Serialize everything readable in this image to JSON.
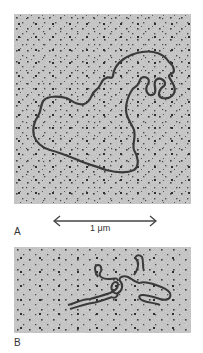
{
  "figure": {
    "panels": [
      {
        "id": "A",
        "label": "A",
        "description": "electron micrograph of relaxed circular DNA molecule"
      },
      {
        "id": "B",
        "label": "B",
        "description": "electron micrograph of supercoiled DNA molecule"
      }
    ],
    "scale_bar": {
      "label": "1 μm"
    },
    "colors": {
      "background": "#b9b9b9",
      "strand": "#3a3a3a",
      "speckle": "#4a4a4a",
      "text": "#333333"
    }
  }
}
